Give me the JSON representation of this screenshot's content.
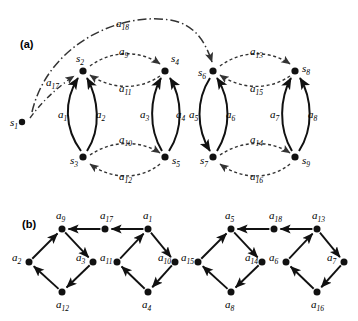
{
  "figure": {
    "panels": [
      {
        "id": "a",
        "label": "(a)"
      },
      {
        "id": "b",
        "label": "(b)"
      }
    ],
    "colors": {
      "stroke": "#111111",
      "node": "#111111",
      "background": "#ffffff",
      "dashed": "#444444"
    }
  },
  "panel_a": {
    "label": "(a)",
    "states": [
      {
        "name": "s",
        "sub": "1",
        "x": 22,
        "y": 122
      },
      {
        "name": "s",
        "sub": "2",
        "x": 83,
        "y": 70
      },
      {
        "name": "s",
        "sub": "3",
        "x": 83,
        "y": 158
      },
      {
        "name": "s",
        "sub": "4",
        "x": 166,
        "y": 70
      },
      {
        "name": "s",
        "sub": "5",
        "x": 166,
        "y": 158
      },
      {
        "name": "s",
        "sub": "6",
        "x": 213,
        "y": 70
      },
      {
        "name": "s",
        "sub": "7",
        "x": 213,
        "y": 158
      },
      {
        "name": "s",
        "sub": "8",
        "x": 296,
        "y": 70
      },
      {
        "name": "s",
        "sub": "9",
        "x": 296,
        "y": 158
      }
    ],
    "state_labels": [
      {
        "text": "s",
        "sub": "1",
        "x": 10,
        "y": 126
      },
      {
        "text": "s",
        "sub": "2",
        "x": 76,
        "y": 62
      },
      {
        "text": "s",
        "sub": "3",
        "x": 70,
        "y": 164
      },
      {
        "text": "s",
        "sub": "4",
        "x": 171,
        "y": 62
      },
      {
        "text": "s",
        "sub": "5",
        "x": 172,
        "y": 164
      },
      {
        "text": "s",
        "sub": "6",
        "x": 198,
        "y": 76
      },
      {
        "text": "s",
        "sub": "7",
        "x": 200,
        "y": 164
      },
      {
        "text": "s",
        "sub": "8",
        "x": 302,
        "y": 72
      },
      {
        "text": "s",
        "sub": "9",
        "x": 302,
        "y": 164
      }
    ],
    "arc_labels": [
      {
        "text": "a",
        "sub": "1",
        "x": 58,
        "y": 118,
        "style": "solid"
      },
      {
        "text": "a",
        "sub": "2",
        "x": 96,
        "y": 118,
        "style": "solid"
      },
      {
        "text": "a",
        "sub": "3",
        "x": 140,
        "y": 118,
        "style": "solid"
      },
      {
        "text": "a",
        "sub": "4",
        "x": 176,
        "y": 118,
        "style": "solid"
      },
      {
        "text": "a",
        "sub": "5",
        "x": 189,
        "y": 118,
        "style": "solid"
      },
      {
        "text": "a",
        "sub": "6",
        "x": 226,
        "y": 118,
        "style": "solid"
      },
      {
        "text": "a",
        "sub": "7",
        "x": 270,
        "y": 118,
        "style": "solid"
      },
      {
        "text": "a",
        "sub": "8",
        "x": 308,
        "y": 118,
        "style": "solid"
      },
      {
        "text": "a",
        "sub": "9",
        "x": 119,
        "y": 55,
        "style": "dashed"
      },
      {
        "text": "a",
        "sub": "10",
        "x": 119,
        "y": 143,
        "style": "dashed"
      },
      {
        "text": "a",
        "sub": "11",
        "x": 119,
        "y": 92,
        "style": "dashed"
      },
      {
        "text": "a",
        "sub": "12",
        "x": 119,
        "y": 180,
        "style": "dashed"
      },
      {
        "text": "a",
        "sub": "13",
        "x": 250,
        "y": 55,
        "style": "dashed"
      },
      {
        "text": "a",
        "sub": "14",
        "x": 250,
        "y": 143,
        "style": "dashed"
      },
      {
        "text": "a",
        "sub": "15",
        "x": 250,
        "y": 92,
        "style": "dashed"
      },
      {
        "text": "a",
        "sub": "16",
        "x": 250,
        "y": 180,
        "style": "dashed"
      },
      {
        "text": "a",
        "sub": "17",
        "x": 46,
        "y": 86,
        "style": "dashdot"
      },
      {
        "text": "a",
        "sub": "18",
        "x": 116,
        "y": 27,
        "style": "dashdot"
      }
    ],
    "edges": [
      {
        "id": "a1",
        "from": "s3",
        "to": "s2",
        "style": "solid",
        "shape": "curve-left"
      },
      {
        "id": "a2",
        "from": "s3",
        "to": "s2",
        "style": "solid",
        "shape": "curve-right"
      },
      {
        "id": "a3",
        "from": "s5",
        "to": "s4",
        "style": "solid",
        "shape": "curve-left"
      },
      {
        "id": "a4",
        "from": "s5",
        "to": "s4",
        "style": "solid",
        "shape": "curve-right"
      },
      {
        "id": "a5",
        "from": "s6",
        "to": "s7",
        "style": "solid",
        "shape": "curve-left"
      },
      {
        "id": "a6",
        "from": "s7",
        "to": "s6",
        "style": "solid",
        "shape": "curve-right"
      },
      {
        "id": "a7",
        "from": "s9",
        "to": "s8",
        "style": "solid",
        "shape": "curve-left"
      },
      {
        "id": "a8",
        "from": "s9",
        "to": "s8",
        "style": "solid",
        "shape": "curve-right"
      },
      {
        "id": "a9",
        "from": "s2",
        "to": "s4",
        "style": "dashed",
        "shape": "arc-up"
      },
      {
        "id": "a11",
        "from": "s4",
        "to": "s2",
        "style": "dashed",
        "shape": "arc-down"
      },
      {
        "id": "a10",
        "from": "s3",
        "to": "s5",
        "style": "dashed",
        "shape": "arc-up"
      },
      {
        "id": "a12",
        "from": "s5",
        "to": "s3",
        "style": "dashed",
        "shape": "arc-down"
      },
      {
        "id": "a13",
        "from": "s6",
        "to": "s8",
        "style": "dashed",
        "shape": "arc-up"
      },
      {
        "id": "a15",
        "from": "s8",
        "to": "s6",
        "style": "dashed",
        "shape": "arc-down"
      },
      {
        "id": "a14",
        "from": "s7",
        "to": "s9",
        "style": "dashed",
        "shape": "arc-up"
      },
      {
        "id": "a16",
        "from": "s9",
        "to": "s7",
        "style": "dashed",
        "shape": "arc-down"
      },
      {
        "id": "a17",
        "from": "s1",
        "to": "s2",
        "style": "dashdot",
        "shape": "curve"
      },
      {
        "id": "a18",
        "from": "s1",
        "to": "s6",
        "style": "dashdot",
        "shape": "big-arc"
      }
    ]
  },
  "panel_b": {
    "label": "(b)",
    "nodes": [
      {
        "id": "b-a9",
        "text": "a",
        "sub": "9",
        "x": 62,
        "y": 229,
        "lx": 56,
        "ly": 219
      },
      {
        "id": "b-a17",
        "text": "a",
        "sub": "17",
        "x": 105,
        "y": 229,
        "lx": 100,
        "ly": 219
      },
      {
        "id": "b-a1",
        "text": "a",
        "sub": "1",
        "x": 148,
        "y": 229,
        "lx": 143,
        "ly": 219
      },
      {
        "id": "b-a2",
        "text": "a",
        "sub": "2",
        "x": 29,
        "y": 262,
        "lx": 12,
        "ly": 261
      },
      {
        "id": "b-a3",
        "text": "a",
        "sub": "3",
        "x": 93,
        "y": 262,
        "lx": 76,
        "ly": 261
      },
      {
        "id": "b-a11",
        "text": "a",
        "sub": "11",
        "x": 117,
        "y": 262,
        "lx": 100,
        "ly": 261
      },
      {
        "id": "b-a10",
        "text": "a",
        "sub": "10",
        "x": 175,
        "y": 262,
        "lx": 158,
        "ly": 261
      },
      {
        "id": "b-a12",
        "text": "a",
        "sub": "12",
        "x": 62,
        "y": 292,
        "lx": 56,
        "ly": 308
      },
      {
        "id": "b-a4",
        "text": "a",
        "sub": "4",
        "x": 148,
        "y": 292,
        "lx": 142,
        "ly": 308
      },
      {
        "id": "b-a5",
        "text": "a",
        "sub": "5",
        "x": 231,
        "y": 229,
        "lx": 225,
        "ly": 219
      },
      {
        "id": "b-a18",
        "text": "a",
        "sub": "18",
        "x": 274,
        "y": 229,
        "lx": 269,
        "ly": 219
      },
      {
        "id": "b-a13",
        "text": "a",
        "sub": "13",
        "x": 317,
        "y": 229,
        "lx": 312,
        "ly": 219
      },
      {
        "id": "b-a15",
        "text": "a",
        "sub": "15",
        "x": 198,
        "y": 262,
        "lx": 181,
        "ly": 261
      },
      {
        "id": "b-a14",
        "text": "a",
        "sub": "14",
        "x": 262,
        "y": 262,
        "lx": 245,
        "ly": 261
      },
      {
        "id": "b-a6",
        "text": "a",
        "sub": "6",
        "x": 286,
        "y": 262,
        "lx": 269,
        "ly": 261
      },
      {
        "id": "b-a7",
        "text": "a",
        "sub": "7",
        "x": 344,
        "y": 262,
        "lx": 327,
        "ly": 261
      },
      {
        "id": "b-a8",
        "text": "a",
        "sub": "8",
        "x": 231,
        "y": 292,
        "lx": 225,
        "ly": 308
      },
      {
        "id": "b-a16",
        "text": "a",
        "sub": "16",
        "x": 317,
        "y": 292,
        "lx": 311,
        "ly": 308
      }
    ],
    "edges": [
      {
        "from": "b-a2",
        "to": "b-a9"
      },
      {
        "from": "b-a9",
        "to": "b-a3"
      },
      {
        "from": "b-a3",
        "to": "b-a12"
      },
      {
        "from": "b-a12",
        "to": "b-a2"
      },
      {
        "from": "b-a1",
        "to": "b-a17"
      },
      {
        "from": "b-a17",
        "to": "b-a9"
      },
      {
        "from": "b-a11",
        "to": "b-a1"
      },
      {
        "from": "b-a1",
        "to": "b-a10"
      },
      {
        "from": "b-a10",
        "to": "b-a4"
      },
      {
        "from": "b-a4",
        "to": "b-a11"
      },
      {
        "from": "b-a15",
        "to": "b-a5"
      },
      {
        "from": "b-a5",
        "to": "b-a14"
      },
      {
        "from": "b-a14",
        "to": "b-a8"
      },
      {
        "from": "b-a8",
        "to": "b-a15"
      },
      {
        "from": "b-a13",
        "to": "b-a18"
      },
      {
        "from": "b-a18",
        "to": "b-a5"
      },
      {
        "from": "b-a6",
        "to": "b-a13"
      },
      {
        "from": "b-a13",
        "to": "b-a7"
      },
      {
        "from": "b-a7",
        "to": "b-a16"
      },
      {
        "from": "b-a16",
        "to": "b-a6"
      }
    ]
  }
}
